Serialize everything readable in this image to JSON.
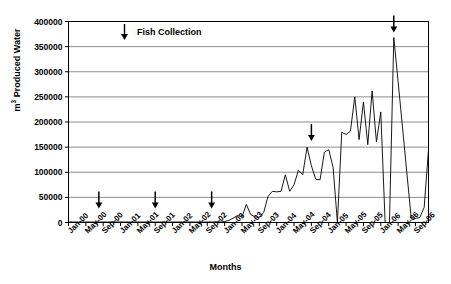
{
  "chart_data": {
    "type": "line",
    "title": "",
    "xlabel": "Months",
    "ylabel": "m³ Produced Water",
    "ylabel_prefix": "m",
    "ylabel_sup": "3",
    "ylabel_suffix": " Produced Water",
    "ylim": [
      0,
      400000
    ],
    "ytick_values": [
      0,
      50000,
      100000,
      150000,
      200000,
      250000,
      300000,
      350000,
      400000
    ],
    "ytick_labels": [
      "0",
      "50000",
      "100000",
      "150000",
      "200000",
      "250000",
      "300000",
      "350000",
      "400000"
    ],
    "grid": true,
    "grid_axis": "y",
    "legend_position": "inside-top-left",
    "legend_entries": [
      {
        "label": "Fish Collection",
        "marker": "down-arrow",
        "color": "#000000"
      }
    ],
    "xtick_labels": [
      "Jan-00",
      "May-00",
      "Sep-00",
      "Jan-01",
      "May-01",
      "Sep-01",
      "Jan-02",
      "May-02",
      "Sep-02",
      "Jan-03",
      "May-03",
      "Sep-03",
      "Jan-04",
      "May-04",
      "Sep-04",
      "Jan-05",
      "May-05",
      "Sep-05",
      "Jan-06",
      "May-06",
      "Sep-06"
    ],
    "xtick_interval_months": 4,
    "x_start": "Jan-00",
    "x_end": "Dec-06",
    "x_total_months": 84,
    "series": [
      {
        "name": "Produced Water",
        "color": "#000000",
        "x_months": [
          0,
          1,
          2,
          3,
          4,
          5,
          6,
          7,
          8,
          9,
          10,
          11,
          12,
          13,
          14,
          15,
          16,
          17,
          18,
          19,
          20,
          21,
          22,
          23,
          24,
          25,
          26,
          27,
          28,
          29,
          30,
          31,
          32,
          33,
          34,
          35,
          36,
          37,
          38,
          39,
          40,
          41,
          42,
          43,
          44,
          45,
          46,
          47,
          48,
          49,
          50,
          51,
          52,
          53,
          54,
          55,
          56,
          57,
          58,
          59,
          60,
          61,
          62,
          63,
          64,
          65,
          66,
          67,
          68,
          69,
          70,
          71,
          72,
          73,
          74,
          75,
          76,
          77,
          78,
          79,
          80,
          81,
          82,
          83
        ],
        "values": [
          1000,
          1000,
          1000,
          1000,
          1000,
          1000,
          1000,
          1000,
          1000,
          1000,
          1000,
          1000,
          1000,
          1000,
          1000,
          1000,
          1000,
          1000,
          1000,
          1000,
          1000,
          1000,
          1000,
          1000,
          1000,
          1000,
          1000,
          1000,
          1000,
          1000,
          1000,
          1000,
          1000,
          1000,
          1000,
          1000,
          2000,
          4000,
          9000,
          14000,
          11000,
          36000,
          16000,
          11000,
          10000,
          20000,
          52000,
          62000,
          61000,
          62000,
          95000,
          62000,
          75000,
          104000,
          95000,
          150000,
          113000,
          86000,
          85000,
          140000,
          145000,
          110000,
          0,
          180000,
          175000,
          182000,
          250000,
          165000,
          240000,
          155000,
          262000,
          160000,
          220000,
          0,
          0,
          368000,
          280000,
          190000,
          100000,
          10000,
          8000,
          10000,
          30000,
          145000
        ]
      }
    ],
    "annotations": [
      {
        "label": "Fish Collection",
        "x_month": 7,
        "y_value": 28000,
        "marker": "down-arrow"
      },
      {
        "label": "Fish Collection",
        "x_month": 20,
        "y_value": 28000,
        "marker": "down-arrow"
      },
      {
        "label": "Fish Collection",
        "x_month": 33,
        "y_value": 28000,
        "marker": "down-arrow"
      },
      {
        "label": "Fish Collection",
        "x_month": 56,
        "y_value": 162000,
        "marker": "down-arrow"
      },
      {
        "label": "Fish Collection",
        "x_month": 75,
        "y_value": 378000,
        "marker": "down-arrow"
      }
    ]
  },
  "style": {
    "plot_border_color": "#000000",
    "grid_color": "#808080",
    "line_color": "#000000",
    "background": "#ffffff"
  }
}
